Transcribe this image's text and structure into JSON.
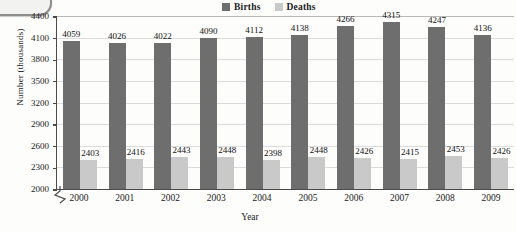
{
  "chart_data": {
    "type": "bar",
    "title": "",
    "xlabel": "Year",
    "ylabel": "Number (thousands)",
    "categories": [
      "2000",
      "2001",
      "2002",
      "2003",
      "2004",
      "2005",
      "2006",
      "2007",
      "2008",
      "2009"
    ],
    "series": [
      {
        "name": "Births",
        "color": "#6e6e6e",
        "values": [
          4059,
          4026,
          4022,
          4090,
          4112,
          4138,
          4266,
          4315,
          4247,
          4136
        ]
      },
      {
        "name": "Deaths",
        "color": "#c9c9c9",
        "values": [
          2403,
          2416,
          2443,
          2448,
          2398,
          2448,
          2426,
          2415,
          2453,
          2426
        ]
      }
    ],
    "ylim": [
      2000,
      4400
    ],
    "yticks": [
      2000,
      2300,
      2600,
      2900,
      3200,
      3500,
      3800,
      4100,
      4400
    ],
    "ytick_labels": [
      "2000",
      "2300",
      "2600",
      "2900",
      "3200",
      "3500",
      "3800",
      "4100",
      "4400"
    ],
    "grid": true,
    "axis_broken": true,
    "legend_position": "top-right"
  },
  "legend": {
    "entries": [
      {
        "label": "Births",
        "color": "#6e6e6e"
      },
      {
        "label": "Deaths",
        "color": "#c9c9c9"
      }
    ]
  },
  "colors": {
    "births": "#6e6e6e",
    "deaths": "#c9c9c9",
    "axis": "#4a4a4a",
    "grid": "#dcdcdc",
    "text": "#1b1b1b",
    "background": "#fdfdfc"
  }
}
